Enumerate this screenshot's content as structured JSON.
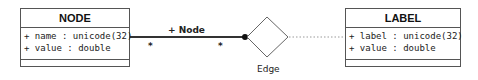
{
  "classes": {
    "node": {
      "name": "NODE",
      "attributes": [
        "+ name : unicode(32)",
        "+ value : double"
      ],
      "operations": []
    },
    "label": {
      "name": "LABEL",
      "attributes": [
        "+ label : unicode(32)",
        "+ value : double"
      ],
      "operations": []
    }
  },
  "association": {
    "role": "+ Node",
    "multiplicity_left": "*",
    "multiplicity_right": "*"
  },
  "association_class_diamond": {
    "name": "Edge"
  },
  "colors": {
    "line": "#333333",
    "border": "#555555",
    "dotted": "#999999"
  }
}
